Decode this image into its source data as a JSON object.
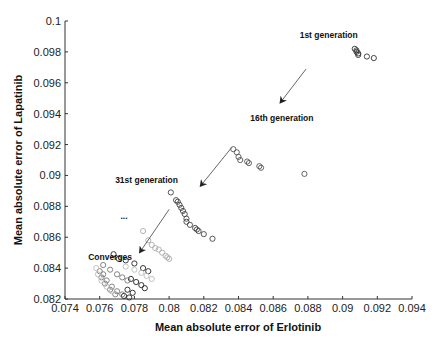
{
  "chart_data": {
    "type": "scatter",
    "title": "",
    "xlabel": "Mean absolute error of Erlotinib",
    "ylabel": "Mean absolute error of Lapatinib",
    "xlim": [
      0.074,
      0.094
    ],
    "ylim": [
      0.082,
      0.1
    ],
    "xticks": [
      0.074,
      0.076,
      0.078,
      0.08,
      0.082,
      0.084,
      0.086,
      0.088,
      0.09,
      0.092,
      0.094
    ],
    "xtick_labels": [
      "0.074",
      "0.076",
      "0.078",
      "0.08",
      "0.082",
      "0.084",
      "0.086",
      "0.088",
      "0.09",
      "0.092",
      "0.094"
    ],
    "yticks": [
      0.082,
      0.084,
      0.086,
      0.088,
      0.09,
      0.092,
      0.094,
      0.096,
      0.098,
      0.1
    ],
    "ytick_labels": [
      "0.082",
      "0.084",
      "0.086",
      "0.088",
      "0.09",
      "0.092",
      "0.094",
      "0.096",
      "0.098",
      "0.1"
    ],
    "grid": false,
    "legend": null,
    "marker": "open-circle",
    "series": [
      {
        "name": "1st generation",
        "color": "#333333",
        "points": [
          [
            0.0907,
            0.0982
          ],
          [
            0.0908,
            0.0981
          ],
          [
            0.0908,
            0.098
          ],
          [
            0.0909,
            0.0979
          ],
          [
            0.0909,
            0.0978
          ],
          [
            0.0914,
            0.0977
          ],
          [
            0.0918,
            0.0976
          ]
        ]
      },
      {
        "name": "16th generation",
        "color": "#555555",
        "points": [
          [
            0.0837,
            0.0917
          ],
          [
            0.0839,
            0.0915
          ],
          [
            0.084,
            0.0912
          ],
          [
            0.0841,
            0.091
          ],
          [
            0.0845,
            0.0909
          ],
          [
            0.0846,
            0.0908
          ],
          [
            0.0852,
            0.0906
          ],
          [
            0.0853,
            0.0905
          ],
          [
            0.0878,
            0.0901
          ]
        ]
      },
      {
        "name": "31st generation",
        "color": "#444444",
        "points": [
          [
            0.0801,
            0.0889
          ],
          [
            0.0804,
            0.0884
          ],
          [
            0.0805,
            0.0883
          ],
          [
            0.0806,
            0.0881
          ],
          [
            0.0807,
            0.0879
          ],
          [
            0.0808,
            0.0877
          ],
          [
            0.0809,
            0.0875
          ],
          [
            0.081,
            0.0872
          ],
          [
            0.081,
            0.087
          ],
          [
            0.0812,
            0.0868
          ],
          [
            0.0815,
            0.0866
          ],
          [
            0.0816,
            0.0865
          ],
          [
            0.0817,
            0.0864
          ],
          [
            0.082,
            0.0862
          ],
          [
            0.0825,
            0.0859
          ]
        ]
      },
      {
        "name": "intermediate generation (light)",
        "color": "#aaaaaa",
        "points": [
          [
            0.0785,
            0.0864
          ],
          [
            0.0788,
            0.0858
          ],
          [
            0.079,
            0.0855
          ],
          [
            0.0792,
            0.0853
          ],
          [
            0.0794,
            0.0852
          ],
          [
            0.0796,
            0.085
          ],
          [
            0.0798,
            0.0848
          ],
          [
            0.0799,
            0.0847
          ],
          [
            0.08,
            0.0846
          ]
        ]
      },
      {
        "name": "converged front (dark)",
        "color": "#222222",
        "points": [
          [
            0.0768,
            0.0849
          ],
          [
            0.0771,
            0.0846
          ],
          [
            0.0775,
            0.0845
          ],
          [
            0.078,
            0.0843
          ],
          [
            0.0785,
            0.084
          ],
          [
            0.0788,
            0.0838
          ],
          [
            0.0778,
            0.0833
          ],
          [
            0.0781,
            0.0831
          ],
          [
            0.0784,
            0.0829
          ],
          [
            0.0786,
            0.0827
          ],
          [
            0.0776,
            0.0826
          ],
          [
            0.0779,
            0.0824
          ],
          [
            0.0774,
            0.0822
          ],
          [
            0.0777,
            0.0821
          ]
        ]
      },
      {
        "name": "converged front (mid gray)",
        "color": "#777777",
        "points": [
          [
            0.0762,
            0.0842
          ],
          [
            0.0766,
            0.0839
          ],
          [
            0.077,
            0.0836
          ],
          [
            0.0773,
            0.0834
          ],
          [
            0.0776,
            0.0832
          ],
          [
            0.0762,
            0.0836
          ],
          [
            0.0764,
            0.0832
          ],
          [
            0.0767,
            0.0828
          ],
          [
            0.077,
            0.0825
          ],
          [
            0.0773,
            0.0823
          ],
          [
            0.076,
            0.0838
          ],
          [
            0.0761,
            0.0834
          ],
          [
            0.0763,
            0.083
          ],
          [
            0.0766,
            0.0826
          ],
          [
            0.0769,
            0.0823
          ]
        ]
      },
      {
        "name": "converged front (light gray)",
        "color": "#bbbbbb",
        "points": [
          [
            0.0775,
            0.0841
          ],
          [
            0.078,
            0.0839
          ],
          [
            0.0784,
            0.0837
          ],
          [
            0.0787,
            0.0835
          ],
          [
            0.079,
            0.0833
          ],
          [
            0.0758,
            0.084
          ],
          [
            0.0759,
            0.0836
          ],
          [
            0.0761,
            0.0832
          ],
          [
            0.0764,
            0.0828
          ],
          [
            0.0767,
            0.0825
          ]
        ]
      }
    ],
    "annotations": [
      {
        "text": "1st generation",
        "x": 0.0892,
        "y": 0.0989
      },
      {
        "text": "16th generation",
        "x": 0.0865,
        "y": 0.0935
      },
      {
        "text": "31st generation",
        "x": 0.0787,
        "y": 0.0895
      },
      {
        "text": "...",
        "x": 0.0774,
        "y": 0.0872
      },
      {
        "text": "Converges",
        "x": 0.0766,
        "y": 0.0845
      }
    ],
    "arrows": [
      {
        "from": [
          0.0879,
          0.0969
        ],
        "to": [
          0.0864,
          0.0947
        ]
      },
      {
        "from": [
          0.0836,
          0.0918
        ],
        "to": [
          0.0818,
          0.0893
        ]
      },
      {
        "from": [
          0.08,
          0.0878
        ],
        "to": [
          0.0783,
          0.085
        ]
      }
    ]
  }
}
